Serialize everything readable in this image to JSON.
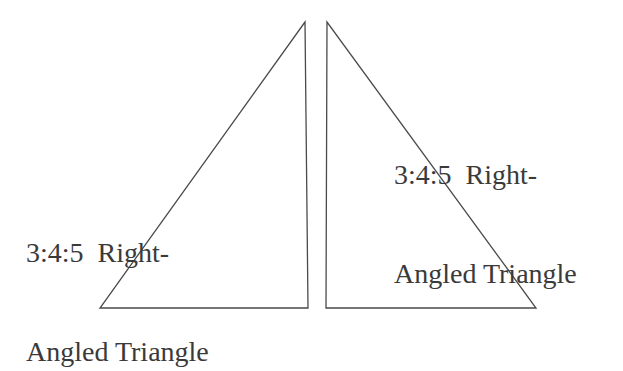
{
  "diagram": {
    "triangles": [
      {
        "id": "left",
        "orientation": "right-angle-at-bottom-right",
        "points": "305,22 100,308 308,308",
        "label": {
          "line1": "3:4:5  Right-",
          "line2": "Angled Triangle"
        }
      },
      {
        "id": "right",
        "orientation": "right-angle-at-bottom-left",
        "points": "327,22 326,308 536,308",
        "label": {
          "line1": "3:4:5  Right-",
          "line2": "Angled Triangle"
        }
      }
    ],
    "colors": {
      "stroke": "#4a4a4a",
      "text": "#3a3a3a",
      "background": "#ffffff"
    }
  }
}
